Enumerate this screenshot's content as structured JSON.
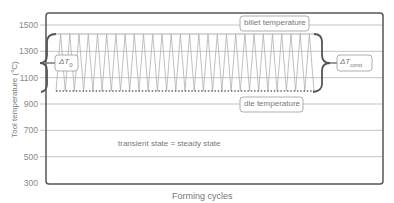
{
  "chart_data": {
    "type": "line",
    "title": "",
    "xlabel": "Forming cycles",
    "ylabel": "Tool temperature (°C)",
    "ylim": [
      300,
      1600
    ],
    "yticks": [
      300,
      500,
      700,
      900,
      1100,
      1300,
      1500
    ],
    "grid": true,
    "series": [
      {
        "name": "billet temperature",
        "style": "solid",
        "value": 1420
      },
      {
        "name": "die temperature",
        "style": "dotted",
        "value": 1000
      },
      {
        "name": "tool surface temperature",
        "style": "zigzag",
        "min": 1000,
        "max": 1420,
        "cycles": 28
      }
    ],
    "annotations": [
      {
        "text": "billet temperature",
        "type": "label-box"
      },
      {
        "text": "die temperature",
        "type": "label-box"
      },
      {
        "text": "ΔT0",
        "type": "brace-left",
        "from": 1000,
        "to": 1420
      },
      {
        "text": "ΔTconst",
        "type": "brace-right",
        "from": 1000,
        "to": 1420
      },
      {
        "text": "transient state = steady state",
        "type": "text"
      }
    ]
  },
  "labels": {
    "xlabel": "Forming cycles",
    "ylabel": "Tool temperature (°C)",
    "billet": "billet temperature",
    "die": "die temperature",
    "state": "transient state = steady state",
    "dt0_main": "ΔT",
    "dt0_sub": "0",
    "dtc_main": "ΔT",
    "dtc_sub": "const"
  },
  "colors": {
    "frame": "#555555",
    "grid": "#aaaaaa",
    "zigzag": "#b0b0b0",
    "text": "#777777",
    "dotted": "#666666"
  }
}
